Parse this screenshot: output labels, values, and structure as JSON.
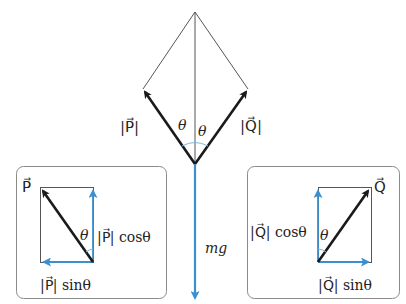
{
  "diagram": {
    "colors": {
      "force": "#1a1a1a",
      "component": "#3a8fd0",
      "frame": "#8a8a8a",
      "thin_line": "#555555",
      "angle_arc": "#7fb6df"
    },
    "main": {
      "label_P": "|P⃗|",
      "label_Q": "|Q⃗|",
      "theta_left": "θ",
      "theta_right": "θ",
      "weight_label": "mg"
    },
    "left_panel": {
      "vector_label": "P⃗",
      "theta": "θ",
      "vertical_component": "|P⃗| cosθ",
      "horizontal_component": "|P⃗| sinθ"
    },
    "right_panel": {
      "vector_label": "Q⃗",
      "theta": "θ",
      "vertical_component": "|Q⃗| cosθ",
      "horizontal_component": "|Q⃗| sinθ"
    }
  }
}
